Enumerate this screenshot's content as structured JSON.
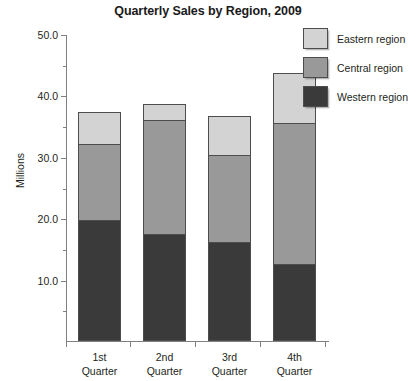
{
  "chart_data": {
    "type": "bar",
    "stacked": true,
    "title": "Quarterly Sales by Region, 2009",
    "xlabel": "",
    "ylabel": "Millions",
    "categories": [
      "1st Quarter",
      "2nd Quarter",
      "3rd Quarter",
      "4th Quarter"
    ],
    "category_lines": [
      [
        "1st",
        "Quarter"
      ],
      [
        "2nd",
        "Quarter"
      ],
      [
        "3rd",
        "Quarter"
      ],
      [
        "4th",
        "Quarter"
      ]
    ],
    "series": [
      {
        "name": "Western region",
        "color": "#3a3a3a",
        "values": [
          19.7,
          17.5,
          16.2,
          12.6
        ]
      },
      {
        "name": "Central region",
        "color": "#999999",
        "values": [
          12.6,
          18.6,
          14.3,
          23.1
        ]
      },
      {
        "name": "Eastern region",
        "color": "#d3d3d3",
        "values": [
          5.4,
          2.9,
          6.5,
          8.2
        ]
      }
    ],
    "totals": [
      37.7,
      39.0,
      37.0,
      43.9
    ],
    "ylim": [
      0,
      50
    ],
    "yticks": [
      10.0,
      20.0,
      30.0,
      40.0,
      50.0
    ],
    "ytick_labels": [
      "10.0",
      "20.0",
      "30.0",
      "40.0",
      "50.0"
    ],
    "yticks_minor": [
      5.0,
      15.0,
      25.0,
      35.0,
      45.0
    ],
    "grid": false,
    "legend_position": "top-right",
    "legend": [
      {
        "label": "Eastern region",
        "color": "#d3d3d3"
      },
      {
        "label": "Central region",
        "color": "#999999"
      },
      {
        "label": "Western region",
        "color": "#3a3a3a"
      }
    ]
  }
}
